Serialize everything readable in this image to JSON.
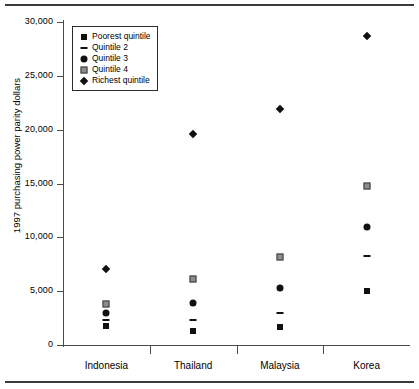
{
  "chart_data": {
    "type": "scatter",
    "title": "",
    "xlabel": "",
    "ylabel": "1997 purchasing power parity dollars",
    "ylim": [
      0,
      30000
    ],
    "yticks": [
      "0",
      "5,000",
      "10,000",
      "15,000",
      "20,000",
      "25,000",
      "30,000"
    ],
    "ytick_values": [
      0,
      5000,
      10000,
      15000,
      20000,
      25000,
      30000
    ],
    "grid": false,
    "legend_position": "top-left-inside",
    "categories": [
      "Indonesia",
      "Thailand",
      "Malaysia",
      "Korea"
    ],
    "series": [
      {
        "name": "Poorest quintile",
        "marker": "filled-square",
        "color": "#111111",
        "values": [
          1800,
          1300,
          1700,
          5000
        ]
      },
      {
        "name": "Quintile 2",
        "marker": "dash",
        "color": "#111111",
        "values": [
          2300,
          2300,
          3000,
          8300
        ]
      },
      {
        "name": "Quintile 3",
        "marker": "filled-circle",
        "color": "#111111",
        "values": [
          3000,
          3900,
          5300,
          11000
        ]
      },
      {
        "name": "Quintile 4",
        "marker": "gray-square",
        "color": "#8c8c8c",
        "values": [
          3800,
          6100,
          8200,
          14800
        ]
      },
      {
        "name": "Richest quintile",
        "marker": "filled-diamond",
        "color": "#111111",
        "values": [
          7100,
          19600,
          21900,
          28700
        ]
      }
    ]
  },
  "legend": {
    "items": [
      {
        "label": "Poorest quintile",
        "marker": "filled-square"
      },
      {
        "label": "Quintile 2",
        "marker": "dash"
      },
      {
        "label": "Quintile 3",
        "marker": "filled-circle"
      },
      {
        "label": "Quintile 4",
        "marker": "gray-square"
      },
      {
        "label": "Richest quintile",
        "marker": "filled-diamond"
      }
    ]
  }
}
